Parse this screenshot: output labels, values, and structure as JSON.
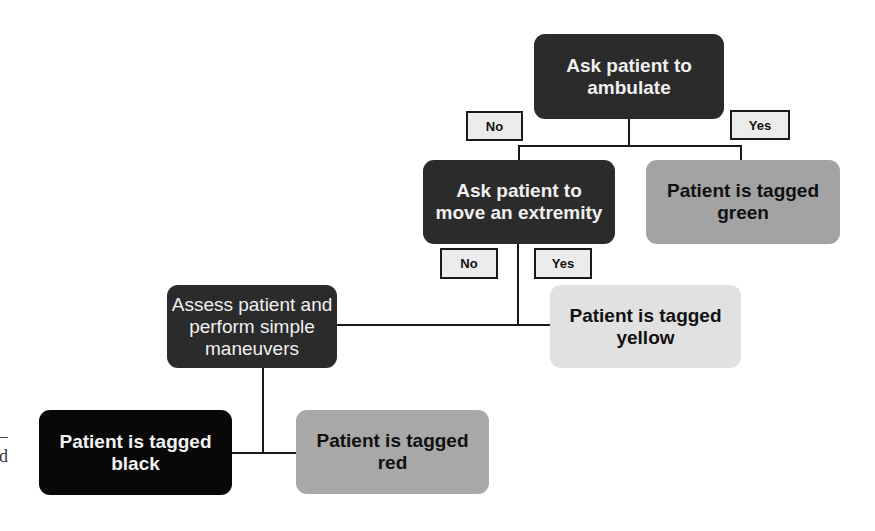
{
  "diagram": {
    "type": "flowchart",
    "nodes": {
      "ambulate": "Ask patient to\nambulate",
      "extremity": "Ask patient to\nmove an extremity",
      "green": "Patient is tagged\ngreen",
      "assess": "Assess patient and\nperform simple\nmaneuvers",
      "yellow": "Patient is tagged\nyellow",
      "black": "Patient is tagged\nblack",
      "red": "Patient is tagged\nred"
    },
    "labels": {
      "no_1": "No",
      "yes_1": "Yes",
      "no_2": "No",
      "yes_2": "Yes"
    },
    "margin_fragment": "d",
    "edges": [
      {
        "from": "ambulate",
        "to": "extremity",
        "label": "No"
      },
      {
        "from": "ambulate",
        "to": "green",
        "label": "Yes"
      },
      {
        "from": "extremity",
        "to": "assess",
        "label": "No"
      },
      {
        "from": "extremity",
        "to": "yellow",
        "label": "Yes"
      },
      {
        "from": "assess",
        "to": "black"
      },
      {
        "from": "assess",
        "to": "red"
      }
    ]
  }
}
